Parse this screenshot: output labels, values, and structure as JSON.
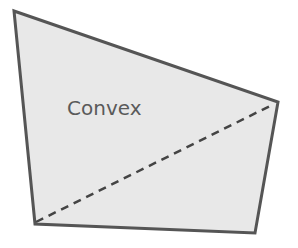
{
  "diagram": {
    "label": "Convex",
    "shape": "quadrilateral",
    "vertices": [
      [
        14,
        11
      ],
      [
        278,
        102
      ],
      [
        255,
        233
      ],
      [
        35,
        224
      ]
    ],
    "diagonal": {
      "from": [
        36,
        222
      ],
      "to": [
        274,
        104
      ],
      "style": "dashed"
    },
    "colors": {
      "fill": "#e8e8e8",
      "stroke": "#555555",
      "diagonal": "#444444",
      "label": "#5a5a5a",
      "background": "#ffffff"
    }
  }
}
